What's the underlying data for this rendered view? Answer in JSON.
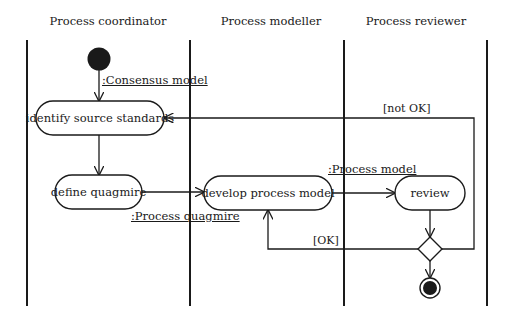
{
  "swimlanes": [
    {
      "id": "coordinator",
      "title": "Process coordinator"
    },
    {
      "id": "modeller",
      "title": "Process modeller"
    },
    {
      "id": "reviewer",
      "title": "Process reviewer"
    }
  ],
  "nodes": {
    "start": {
      "type": "initial"
    },
    "identify": {
      "type": "action",
      "label": "identify source standards",
      "lane": "coordinator"
    },
    "define": {
      "type": "action",
      "label": "define quagmire",
      "lane": "coordinator"
    },
    "develop": {
      "type": "action",
      "label": "develop process model",
      "lane": "modeller"
    },
    "review": {
      "type": "action",
      "label": "review",
      "lane": "reviewer"
    },
    "decision": {
      "type": "decision"
    },
    "end": {
      "type": "final"
    }
  },
  "object_flows": {
    "consensus_model": ":Consensus model",
    "process_quagmire": ":Process quagmire",
    "process_model": ":Process model"
  },
  "guards": {
    "not_ok": "[not OK]",
    "ok": "[OK]"
  },
  "edges": [
    {
      "from": "start",
      "to": "identify",
      "object": ":Consensus model"
    },
    {
      "from": "identify",
      "to": "define"
    },
    {
      "from": "define",
      "to": "develop",
      "object": ":Process quagmire"
    },
    {
      "from": "develop",
      "to": "review",
      "object": ":Process model"
    },
    {
      "from": "review",
      "to": "decision"
    },
    {
      "from": "decision",
      "to": "identify",
      "guard": "[not OK]"
    },
    {
      "from": "decision",
      "to": "develop",
      "guard": "[OK]"
    },
    {
      "from": "decision",
      "to": "end"
    }
  ],
  "colors": {
    "stroke": "#1a1a1a",
    "background": "#ffffff"
  }
}
